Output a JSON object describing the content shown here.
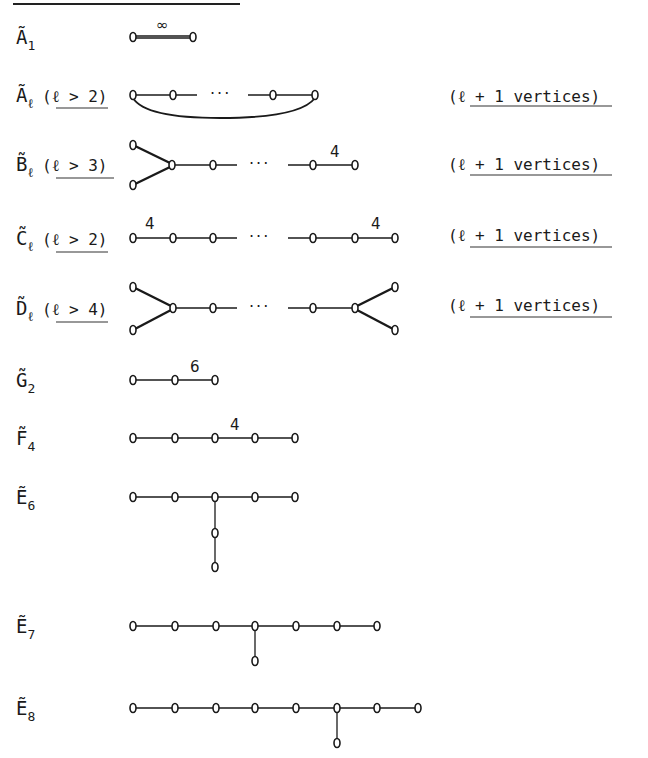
{
  "title_rule": {
    "visible": true
  },
  "diagrams": [
    {
      "id": "A1",
      "label": "Ã",
      "subscript": "1",
      "condition": "",
      "vertices_note": "",
      "edge_label": "∞"
    },
    {
      "id": "Al",
      "label": "Ã",
      "subscript": "ℓ",
      "condition": "(ℓ > 2)",
      "vertices_note": "(ℓ + 1 vertices)",
      "dots": "···"
    },
    {
      "id": "Bl",
      "label": "B̃",
      "subscript": "ℓ",
      "condition": "(ℓ > 3)",
      "vertices_note": "(ℓ + 1 vertices)",
      "dots": "···",
      "edge_label": "4"
    },
    {
      "id": "Cl",
      "label": "C̃",
      "subscript": "ℓ",
      "condition": "(ℓ > 2)",
      "vertices_note": "(ℓ + 1 vertices)",
      "dots": "···",
      "edge_label_left": "4",
      "edge_label_right": "4"
    },
    {
      "id": "Dl",
      "label": "D̃",
      "subscript": "ℓ",
      "condition": "(ℓ > 4)",
      "vertices_note": "(ℓ + 1 vertices)",
      "dots": "···"
    },
    {
      "id": "G2",
      "label": "G̃",
      "subscript": "2",
      "edge_label": "6"
    },
    {
      "id": "F4",
      "label": "F̃",
      "subscript": "4",
      "edge_label": "4"
    },
    {
      "id": "E6",
      "label": "Ẽ",
      "subscript": "6"
    },
    {
      "id": "E7",
      "label": "Ẽ",
      "subscript": "7"
    },
    {
      "id": "E8",
      "label": "Ẽ",
      "subscript": "8"
    }
  ]
}
